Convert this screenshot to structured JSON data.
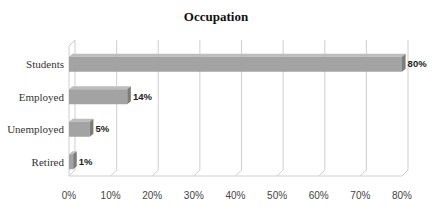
{
  "chart_data": {
    "type": "bar",
    "orientation": "horizontal",
    "style": "3d",
    "title": "Occupation",
    "xlabel": "",
    "ylabel": "",
    "categories": [
      "Students",
      "Employed",
      "Unemployed",
      "Retired"
    ],
    "values": [
      80,
      14,
      5,
      1
    ],
    "data_labels": [
      "80%",
      "14%",
      "5%",
      "1%"
    ],
    "x_ticks": [
      "0%",
      "10%",
      "20%",
      "30%",
      "40%",
      "50%",
      "60%",
      "70%",
      "80%"
    ],
    "xlim": [
      0,
      80
    ],
    "grid": true,
    "legend": null,
    "bar_color": "#a3a3a3"
  }
}
